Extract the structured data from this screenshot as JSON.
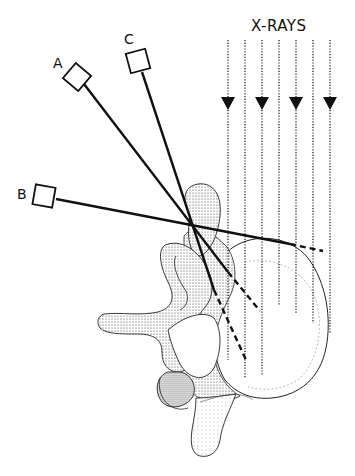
{
  "diagram": {
    "title_label": "X-RAYS",
    "detectors": [
      {
        "id": "A",
        "label": "A"
      },
      {
        "id": "B",
        "label": "B"
      },
      {
        "id": "C",
        "label": "C"
      }
    ],
    "xray_beam": {
      "line_count": 7,
      "arrow_count": 4,
      "direction": "down"
    },
    "colors": {
      "ink": "#111111",
      "stipple": "#444444",
      "background": "#ffffff"
    }
  }
}
